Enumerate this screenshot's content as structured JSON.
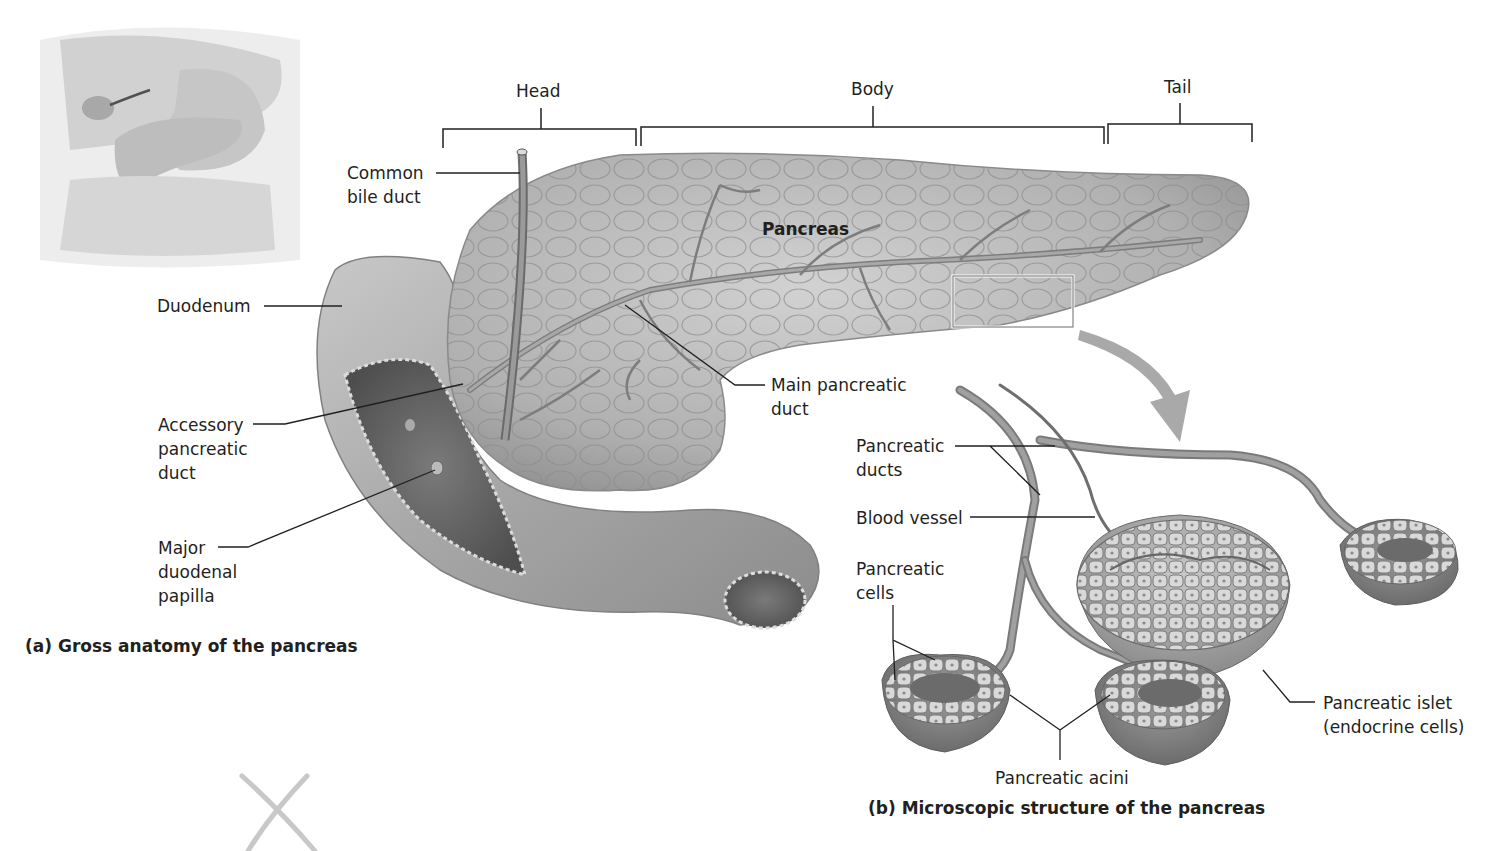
{
  "figure": {
    "panel_a": {
      "caption": "(a) Gross anatomy of the pancreas",
      "regions": {
        "head": "Head",
        "body": "Body",
        "tail": "Tail"
      },
      "organ_label": "Pancreas",
      "labels": {
        "common_bile_duct": [
          "Common",
          "bile duct"
        ],
        "duodenum": "Duodenum",
        "accessory_pancreatic_duct": [
          "Accessory",
          "pancreatic",
          "duct"
        ],
        "major_duodenal_papilla": [
          "Major",
          "duodenal",
          "papilla"
        ],
        "main_pancreatic_duct": [
          "Main pancreatic",
          "duct"
        ]
      }
    },
    "panel_b": {
      "caption": "(b) Microscopic structure of the pancreas",
      "labels": {
        "pancreatic_ducts": [
          "Pancreatic",
          "ducts"
        ],
        "blood_vessel": "Blood vessel",
        "pancreatic_cells": [
          "Pancreatic",
          "cells"
        ],
        "pancreatic_islet": [
          "Pancreatic islet",
          "(endocrine cells)"
        ],
        "pancreatic_acini": "Pancreatic acini"
      }
    },
    "colors": {
      "organ_fill": "#b8b8b8",
      "organ_dark": "#8a8a8a",
      "duct": "#7d7d7d",
      "leader_line": "#231f20",
      "arrow": "#a9a9a9"
    }
  }
}
